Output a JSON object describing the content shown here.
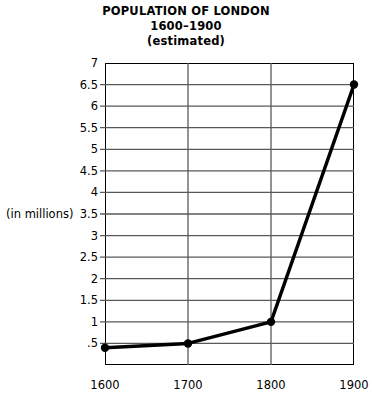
{
  "title": {
    "line1": "POPULATION OF LONDON",
    "line2": "1600–1900",
    "line3": "(estimated)"
  },
  "axis": {
    "y_title": "(in millions)",
    "y_tick_labels": [
      "7",
      "6.5",
      "6",
      "5.5",
      "5",
      "4.5",
      "4",
      "3.5",
      "3",
      "2.5",
      "2",
      "1.5",
      "1",
      ".5"
    ],
    "x_tick_labels": [
      "1600",
      "1700",
      "1800",
      "1900"
    ]
  },
  "colors": {
    "line": "#000000",
    "grid": "#595959",
    "frame": "#000000",
    "text": "#000000",
    "background": "#ffffff"
  },
  "chart_data": {
    "type": "line",
    "title": "POPULATION OF LONDON 1600–1900 (estimated)",
    "xlabel": "",
    "ylabel": "(in millions)",
    "x": [
      1600,
      1700,
      1800,
      1900
    ],
    "categories": [
      "1600",
      "1700",
      "1800",
      "1900"
    ],
    "values": [
      0.4,
      0.5,
      1.0,
      6.5
    ],
    "series": [
      {
        "name": "Population of London (millions)",
        "values": [
          0.4,
          0.5,
          1.0,
          6.5
        ]
      }
    ],
    "xlim": [
      1600,
      1900
    ],
    "ylim": [
      0,
      7
    ],
    "ytick_values": [
      0.5,
      1,
      1.5,
      2,
      2.5,
      3,
      3.5,
      4,
      4.5,
      5,
      5.5,
      6,
      6.5,
      7
    ],
    "xtick_values": [
      1600,
      1700,
      1800,
      1900
    ],
    "grid": true,
    "grid_orientation": "both",
    "legend": "none",
    "markers": "filled-circle"
  }
}
